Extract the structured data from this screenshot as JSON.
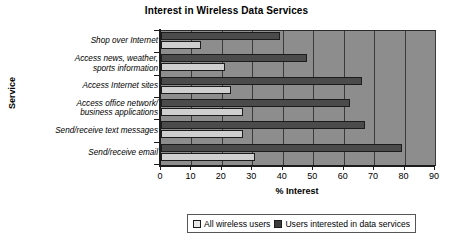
{
  "chart_data": {
    "type": "bar",
    "orientation": "horizontal",
    "title": "Interest in Wireless Data Services",
    "xlabel": "% Interest",
    "ylabel": "Service",
    "xlim": [
      0,
      90
    ],
    "xticks": [
      "0",
      "10",
      "20",
      "30",
      "40",
      "50",
      "60",
      "70",
      "80",
      "90"
    ],
    "grid": true,
    "legend_position": "bottom",
    "categories": [
      "Shop over Internet",
      "Access news, weather, sports information",
      "Access Internet sites",
      "Access office network/ business applications",
      "Send/receive text messages",
      "Send/receive email"
    ],
    "category_lines": [
      [
        "Shop over Internet"
      ],
      [
        "Access news, weather,",
        "sports information"
      ],
      [
        "Access Internet sites"
      ],
      [
        "Access office network/",
        "business applications"
      ],
      [
        "Send/receive text messages"
      ],
      [
        "Send/receive email"
      ]
    ],
    "series": [
      {
        "name": "All wireless users",
        "color": "#cfcfcf",
        "values": [
          13,
          21,
          23,
          27,
          27,
          31
        ]
      },
      {
        "name": "Users interested in data services",
        "color": "#4b4b4b",
        "values": [
          39,
          48,
          66,
          62,
          67,
          79
        ]
      }
    ]
  },
  "legend": {
    "items": [
      {
        "label": "All wireless users",
        "swatch": "light"
      },
      {
        "label": "Users interested in data services",
        "swatch": "dark"
      }
    ]
  },
  "colors": {
    "plot_background": "#8d8d8d",
    "axis": "#1c1c1c",
    "gridline": "#3a3a3a",
    "series_light": "#cfcfcf",
    "series_dark": "#4b4b4b"
  }
}
